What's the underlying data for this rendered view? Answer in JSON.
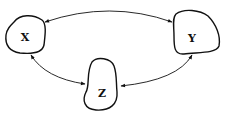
{
  "diagram": {
    "nodes": [
      {
        "id": "X",
        "label": "X"
      },
      {
        "id": "Y",
        "label": "Y"
      },
      {
        "id": "Z",
        "label": "Z"
      }
    ],
    "edges": [
      {
        "from": "X",
        "to": "Y",
        "direction": "bidirectional"
      },
      {
        "from": "X",
        "to": "Z",
        "direction": "bidirectional"
      },
      {
        "from": "Z",
        "to": "Y",
        "direction": "bidirectional"
      }
    ],
    "colors": {
      "stroke": "#111111",
      "background": "#ffffff"
    }
  }
}
